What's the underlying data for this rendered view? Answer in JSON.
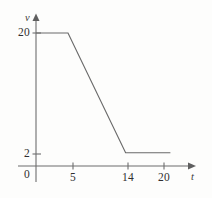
{
  "chart_data": {
    "type": "line",
    "title": "",
    "xlabel": "t",
    "ylabel": "v",
    "xlim": [
      0,
      22.5
    ],
    "ylim": [
      0,
      22.5
    ],
    "grid": false,
    "legend": false,
    "x_ticks": [
      {
        "value": 5,
        "label": "5"
      },
      {
        "value": 14,
        "label": "14"
      },
      {
        "value": 20,
        "label": "20"
      }
    ],
    "y_ticks": [
      {
        "value": 2,
        "label": "2"
      },
      {
        "value": 20,
        "label": "20"
      }
    ],
    "origin_label": "0",
    "series": [
      {
        "name": "v(t)",
        "color": "#6a6a6a",
        "points": [
          {
            "x": 0,
            "y": 20
          },
          {
            "x": 5,
            "y": 20
          },
          {
            "x": 14,
            "y": 2
          },
          {
            "x": 21,
            "y": 2
          }
        ]
      }
    ]
  },
  "axes": {
    "y_axis_label": "v",
    "x_axis_label": "t",
    "origin": "0"
  },
  "ticks": {
    "x": [
      "5",
      "14",
      "20"
    ],
    "y": [
      "20",
      "2"
    ]
  }
}
